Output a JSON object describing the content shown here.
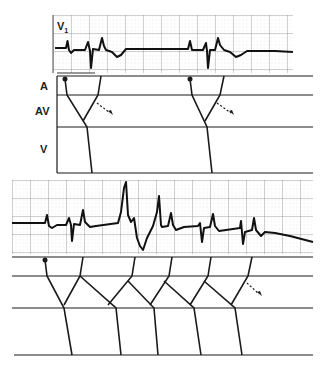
{
  "figure": {
    "lead_label": "V",
    "lead_subscript": "1",
    "ladder_labels": [
      "A",
      "AV",
      "V"
    ],
    "ink_color": "#1a1a1a",
    "grid_color": "#8a8a8a",
    "grid_minor_color": "#c8c8c8",
    "background": "#ffffff"
  },
  "top_panel": {
    "ecg_strip": {
      "x0": 53,
      "x1": 293,
      "y0": 15,
      "y1": 73,
      "baseline": 48
    },
    "ladder": {
      "x0": 57,
      "x1": 313,
      "rows_y": [
        76,
        95,
        127,
        173
      ]
    },
    "beats": [
      {
        "dot": [
          65,
          79
        ],
        "path": [
          [
            65,
            79
          ],
          [
            67,
            95
          ],
          [
            87,
            127
          ],
          [
            92,
            173
          ]
        ],
        "retro": [
          [
            101,
            76
          ],
          [
            98,
            95
          ],
          [
            83,
            121
          ]
        ],
        "arrow": [
          [
            97,
            103
          ],
          [
            112,
            114
          ]
        ]
      },
      {
        "dot": [
          190,
          79
        ],
        "path": [
          [
            190,
            79
          ],
          [
            192,
            95
          ],
          [
            207,
            127
          ],
          [
            212,
            173
          ]
        ],
        "retro": [
          [
            224,
            76
          ],
          [
            220,
            95
          ],
          [
            205,
            121
          ]
        ],
        "arrow": [
          [
            217,
            103
          ],
          [
            234,
            114
          ]
        ]
      }
    ]
  },
  "bottom_panel": {
    "ecg_strip": {
      "x0": 12,
      "x1": 313,
      "y0": 180,
      "y1": 254,
      "baseline": 223
    },
    "ladder": {
      "x0": 12,
      "x1": 313,
      "rows_y": [
        257,
        276,
        308,
        355
      ]
    },
    "dot": [
      45,
      260
    ],
    "arrow": [
      [
        247,
        283
      ],
      [
        262,
        296
      ]
    ]
  }
}
